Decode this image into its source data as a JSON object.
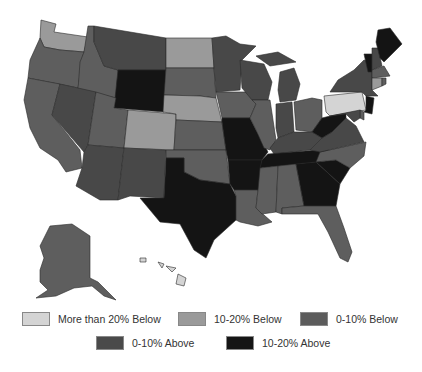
{
  "legend": {
    "items": [
      {
        "label": "More than 20% Below",
        "color": "#d4d4d4"
      },
      {
        "label": "10-20% Below",
        "color": "#9a9a9a"
      },
      {
        "label": "0-10% Below",
        "color": "#5c5c5c"
      },
      {
        "label": "0-10% Above",
        "color": "#4a4a4a"
      },
      {
        "label": "10-20% Above",
        "color": "#151515"
      }
    ]
  },
  "categories": {
    "more_than_20_below": "#d4d4d4",
    "10_20_below": "#9a9a9a",
    "0_10_below": "#5e5e5e",
    "0_10_above": "#484848",
    "10_20_above": "#141414"
  },
  "states": {
    "WA": "10_20_below",
    "OR": "0_10_below",
    "CA": "0_10_below",
    "ID": "0_10_below",
    "NV": "0_10_above",
    "MT": "0_10_above",
    "WY": "10_20_above",
    "UT": "0_10_below",
    "AZ": "0_10_above",
    "CO": "10_20_below",
    "NM": "0_10_above",
    "ND": "10_20_below",
    "SD": "0_10_below",
    "NE": "10_20_below",
    "KS": "0_10_below",
    "OK": "0_10_below",
    "TX": "10_20_above",
    "MN": "0_10_above",
    "IA": "0_10_below",
    "MO": "10_20_above",
    "AR": "10_20_above",
    "LA": "0_10_below",
    "WI": "0_10_above",
    "IL": "0_10_below",
    "MI": "0_10_above",
    "IN": "0_10_above",
    "OH": "0_10_below",
    "KY": "0_10_above",
    "TN": "10_20_above",
    "MS": "0_10_below",
    "AL": "0_10_below",
    "GA": "10_20_above",
    "FL": "0_10_below",
    "SC": "10_20_above",
    "NC": "0_10_below",
    "VA": "0_10_above",
    "WV": "10_20_above",
    "PA": "more_than_20_below",
    "NY": "0_10_above",
    "ME": "10_20_above",
    "VT": "10_20_above",
    "NH": "0_10_above",
    "MA": "0_10_below",
    "CT": "10_20_below",
    "RI": "0_10_below",
    "NJ": "10_20_above",
    "DE": "0_10_below",
    "MD": "0_10_above",
    "AK": "0_10_below",
    "HI": "more_than_20_below"
  }
}
